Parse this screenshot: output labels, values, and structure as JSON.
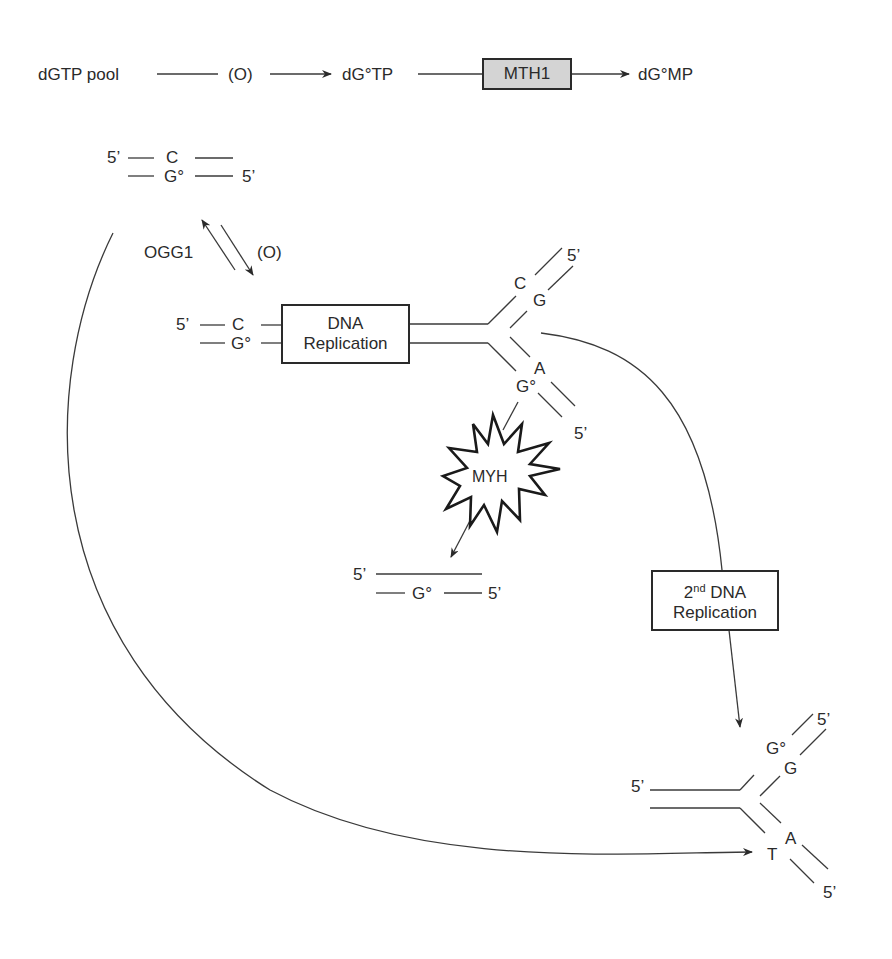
{
  "top_pathway": {
    "pool": "dGTP pool",
    "oxidation": "(O)",
    "oxidized_triphosphate": "dG°TP",
    "enzyme": "MTH1",
    "product": "dG°MP"
  },
  "duplex_top": {
    "prime1": "5’",
    "base_top": "C",
    "base_bottom": "G°",
    "prime2": "5’"
  },
  "repair_step": {
    "enzyme": "OGG1",
    "oxidation": "(O)"
  },
  "duplex_pre_replication": {
    "prime1": "5’",
    "base_top": "C",
    "base_bottom": "G°"
  },
  "replication_box": {
    "line1": "DNA",
    "line2": "Replication"
  },
  "fork1": {
    "upper_base1": "C",
    "upper_base2": "G",
    "upper_prime": "5’",
    "lower_base1": "A",
    "lower_base2": "G°",
    "lower_prime": "5’"
  },
  "myh": {
    "label": "MYH"
  },
  "myh_product": {
    "prime1": "5’",
    "base": "G°",
    "prime2": "5’"
  },
  "replication2_box": {
    "ordinal": "2",
    "ordinal_suffix": "nd",
    "line1_rest": " DNA",
    "line2": "Replication"
  },
  "fork2": {
    "left_prime": "5’",
    "upper_base1": "G°",
    "upper_base2": "G",
    "upper_prime": "5’",
    "lower_base1": "A",
    "lower_base2": "T",
    "lower_prime": "5’"
  }
}
